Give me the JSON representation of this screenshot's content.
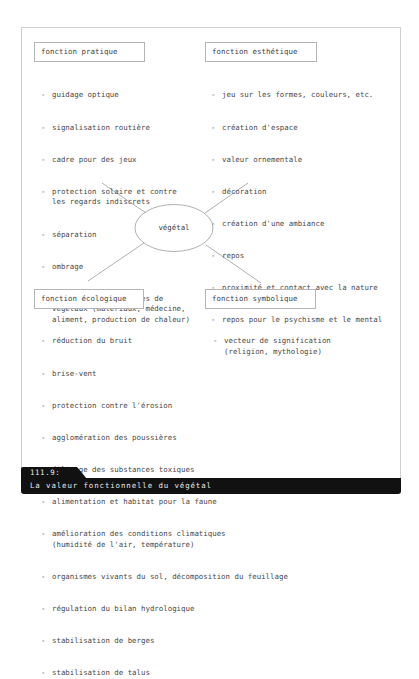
{
  "figure": {
    "center_label": "végétal",
    "caption": {
      "number": "111.9:",
      "title": "La valeur fonctionnelle du végétal"
    }
  },
  "functions": {
    "pratique": {
      "label": "fonction pratique",
      "items": [
        "guidage optique",
        "signalisation routière",
        "cadre pour des jeux",
        "protection solaire et contre\nles regards indiscrets",
        "séparation",
        "ombrage",
        "utilisation de parties de\nvégétaux (matériaux, médecine,\naliment, production de chaleur)"
      ]
    },
    "esthetique": {
      "label": "fonction esthétique",
      "items": [
        "jeu sur les formes, couleurs, etc.",
        "création d'espace",
        "valeur ornementale",
        "décoration",
        "création d'une ambiance",
        "repos",
        "proximité et contact avec la nature",
        "repos pour le psychisme et le mental"
      ]
    },
    "ecologique": {
      "label": "fonction écologique",
      "items": [
        "réduction du bruit",
        "brise-vent",
        "protection contre l'érosion",
        "agglomération des poussières",
        "filtrage des substances toxiques",
        "alimentation et habitat pour la faune",
        "amélioration des conditions climatiques\n(humidité de l'air, température)",
        "organismes vivants du sol, décomposition du feuillage",
        "régulation du bilan hydrologique",
        "stabilisation de berges",
        "stabilisation de talus"
      ]
    },
    "symbolique": {
      "label": "fonction symbolique",
      "items": [
        "vecteur de signification\n(religion, mythologie)"
      ]
    }
  },
  "dash": "-"
}
